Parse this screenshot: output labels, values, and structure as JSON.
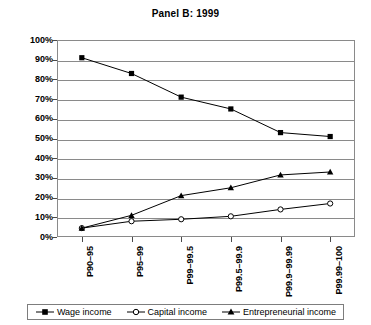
{
  "chart_data": {
    "type": "line",
    "title": "Panel B: 1999",
    "xlabel": "",
    "ylabel": "",
    "ylim": [
      0,
      100
    ],
    "ytick_labels": [
      "0%",
      "10%",
      "20%",
      "30%",
      "40%",
      "50%",
      "60%",
      "70%",
      "80%",
      "90%",
      "100%"
    ],
    "ytick_values": [
      0,
      10,
      20,
      30,
      40,
      50,
      60,
      70,
      80,
      90,
      100
    ],
    "grid": true,
    "legend_position": "bottom",
    "categories": [
      "P90–95",
      "P95–99",
      "P99–99.5",
      "P99.5–99.9",
      "P99.9–99.99",
      "P99.99–100"
    ],
    "series": [
      {
        "name": "Wage income",
        "marker": "filled-square",
        "color": "#000000",
        "values": [
          91,
          83,
          71,
          65,
          53,
          51
        ]
      },
      {
        "name": "Capital income",
        "marker": "open-circle",
        "color": "#000000",
        "values": [
          4.5,
          8,
          9,
          10.5,
          14,
          17
        ]
      },
      {
        "name": "Entrepreneurial income",
        "marker": "filled-triangle",
        "color": "#000000",
        "values": [
          4.5,
          11,
          21,
          25,
          31.5,
          33
        ]
      }
    ]
  },
  "legend": {
    "items": [
      {
        "label": "Wage income",
        "marker": "filled-square"
      },
      {
        "label": "Capital income",
        "marker": "open-circle"
      },
      {
        "label": "Entrepreneurial income",
        "marker": "filled-triangle"
      }
    ]
  }
}
